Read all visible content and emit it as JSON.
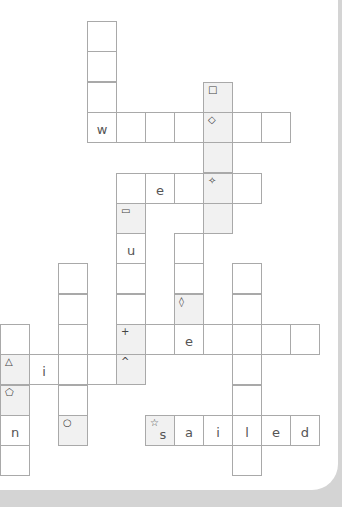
{
  "puzzle": {
    "type": "crossword",
    "cell_width": 29,
    "row_height": 30.3,
    "origin_x": 0,
    "origin_y": 21,
    "colors": {
      "border": "#a9a9a9",
      "shaded": "#f1f1f1",
      "background": "#d4d4d4",
      "panel": "#ffffff"
    },
    "cells": [
      {
        "c": 3,
        "r": 0,
        "letter": "",
        "symbol": "",
        "shaded": false
      },
      {
        "c": 3,
        "r": 1,
        "letter": "",
        "symbol": "",
        "shaded": false
      },
      {
        "c": 3,
        "r": 2,
        "letter": "",
        "symbol": "",
        "shaded": false
      },
      {
        "c": 3,
        "r": 3,
        "letter": "w",
        "symbol": "",
        "shaded": false
      },
      {
        "c": 4,
        "r": 3,
        "letter": "",
        "symbol": "",
        "shaded": false
      },
      {
        "c": 5,
        "r": 3,
        "letter": "",
        "symbol": "",
        "shaded": false
      },
      {
        "c": 6,
        "r": 3,
        "letter": "",
        "symbol": "",
        "shaded": false
      },
      {
        "c": 7,
        "r": 2,
        "letter": "",
        "symbol": "□",
        "shaded": true
      },
      {
        "c": 7,
        "r": 3,
        "letter": "",
        "symbol": "◇",
        "shaded": true
      },
      {
        "c": 8,
        "r": 3,
        "letter": "",
        "symbol": "",
        "shaded": false
      },
      {
        "c": 9,
        "r": 3,
        "letter": "",
        "symbol": "",
        "shaded": false
      },
      {
        "c": 7,
        "r": 4,
        "letter": "",
        "symbol": "",
        "shaded": true
      },
      {
        "c": 4,
        "r": 5,
        "letter": "",
        "symbol": "",
        "shaded": false
      },
      {
        "c": 5,
        "r": 5,
        "letter": "e",
        "symbol": "",
        "shaded": false
      },
      {
        "c": 6,
        "r": 5,
        "letter": "",
        "symbol": "",
        "shaded": false
      },
      {
        "c": 7,
        "r": 5,
        "letter": "",
        "symbol": "✧",
        "shaded": true
      },
      {
        "c": 8,
        "r": 5,
        "letter": "",
        "symbol": "",
        "shaded": false
      },
      {
        "c": 7,
        "r": 6,
        "letter": "",
        "symbol": "",
        "shaded": true
      },
      {
        "c": 4,
        "r": 6,
        "letter": "",
        "symbol": "▭",
        "shaded": true
      },
      {
        "c": 4,
        "r": 7,
        "letter": "u",
        "symbol": "",
        "shaded": false
      },
      {
        "c": 4,
        "r": 8,
        "letter": "",
        "symbol": "",
        "shaded": false
      },
      {
        "c": 4,
        "r": 9,
        "letter": "",
        "symbol": "",
        "shaded": false
      },
      {
        "c": 4,
        "r": 10,
        "letter": "",
        "symbol": "+",
        "shaded": true
      },
      {
        "c": 4,
        "r": 11,
        "letter": "",
        "symbol": "^",
        "shaded": true
      },
      {
        "c": 6,
        "r": 7,
        "letter": "",
        "symbol": "",
        "shaded": false
      },
      {
        "c": 6,
        "r": 8,
        "letter": "",
        "symbol": "",
        "shaded": false
      },
      {
        "c": 6,
        "r": 9,
        "letter": "",
        "symbol": "◊",
        "shaded": true
      },
      {
        "c": 5,
        "r": 10,
        "letter": "",
        "symbol": "",
        "shaded": false
      },
      {
        "c": 6,
        "r": 10,
        "letter": "e",
        "symbol": "",
        "shaded": false
      },
      {
        "c": 7,
        "r": 10,
        "letter": "",
        "symbol": "",
        "shaded": false
      },
      {
        "c": 8,
        "r": 10,
        "letter": "",
        "symbol": "",
        "shaded": false
      },
      {
        "c": 9,
        "r": 10,
        "letter": "",
        "symbol": "",
        "shaded": false
      },
      {
        "c": 10,
        "r": 10,
        "letter": "",
        "symbol": "",
        "shaded": false
      },
      {
        "c": 8,
        "r": 8,
        "letter": "",
        "symbol": "",
        "shaded": false
      },
      {
        "c": 8,
        "r": 9,
        "letter": "",
        "symbol": "",
        "shaded": false
      },
      {
        "c": 8,
        "r": 11,
        "letter": "",
        "symbol": "",
        "shaded": false
      },
      {
        "c": 8,
        "r": 12,
        "letter": "",
        "symbol": "",
        "shaded": false
      },
      {
        "c": 8,
        "r": 14,
        "letter": "",
        "symbol": "",
        "shaded": false
      },
      {
        "c": 2,
        "r": 8,
        "letter": "",
        "symbol": "",
        "shaded": false
      },
      {
        "c": 2,
        "r": 9,
        "letter": "",
        "symbol": "",
        "shaded": false
      },
      {
        "c": 2,
        "r": 10,
        "letter": "",
        "symbol": "",
        "shaded": false
      },
      {
        "c": 2,
        "r": 11,
        "letter": "",
        "symbol": "",
        "shaded": false
      },
      {
        "c": 2,
        "r": 12,
        "letter": "",
        "symbol": "",
        "shaded": false
      },
      {
        "c": 2,
        "r": 13,
        "letter": "",
        "symbol": "○",
        "shaded": true
      },
      {
        "c": 1,
        "r": 11,
        "letter": "i",
        "symbol": "",
        "shaded": false
      },
      {
        "c": 3,
        "r": 11,
        "letter": "",
        "symbol": "",
        "shaded": false
      },
      {
        "c": 0,
        "r": 10,
        "letter": "",
        "symbol": "",
        "shaded": false
      },
      {
        "c": 0,
        "r": 11,
        "letter": "",
        "symbol": "△",
        "shaded": true
      },
      {
        "c": 0,
        "r": 12,
        "letter": "",
        "symbol": "⬠",
        "shaded": true
      },
      {
        "c": 0,
        "r": 13,
        "letter": "n",
        "symbol": "",
        "shaded": false
      },
      {
        "c": 0,
        "r": 14,
        "letter": "",
        "symbol": "",
        "shaded": false
      },
      {
        "c": 5,
        "r": 13,
        "letter": "s",
        "symbol": "☆",
        "shaded": true
      },
      {
        "c": 6,
        "r": 13,
        "letter": "a",
        "symbol": "",
        "shaded": false
      },
      {
        "c": 7,
        "r": 13,
        "letter": "i",
        "symbol": "",
        "shaded": false
      },
      {
        "c": 8,
        "r": 13,
        "letter": "l",
        "symbol": "",
        "shaded": false
      },
      {
        "c": 9,
        "r": 13,
        "letter": "e",
        "symbol": "",
        "shaded": false
      },
      {
        "c": 10,
        "r": 13,
        "letter": "d",
        "symbol": "",
        "shaded": false
      }
    ]
  }
}
